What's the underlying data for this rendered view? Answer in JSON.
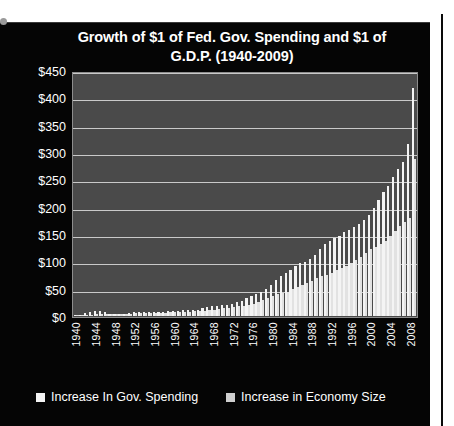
{
  "chart_data": {
    "type": "bar",
    "title": "Growth of $1 of Fed. Gov. Spending and  $1 of G.D.P. (1940-2009)",
    "title_line1": "Growth of $1 of Fed. Gov. Spending and  $1 of",
    "title_line2": "G.D.P. (1940-2009)",
    "xlabel": "",
    "ylabel": "",
    "ylim": [
      0,
      450
    ],
    "grid": true,
    "legend_position": "bottom",
    "ytick_labels": [
      "$450",
      "$400",
      "$350",
      "$300",
      "$250",
      "$200",
      "$150",
      "$100",
      "$50",
      "$0"
    ],
    "ytick_values": [
      450,
      400,
      350,
      300,
      250,
      200,
      150,
      100,
      50,
      0
    ],
    "xtick_labels": [
      "1940",
      "1944",
      "1948",
      "1952",
      "1956",
      "1960",
      "1964",
      "1968",
      "1972",
      "1976",
      "1980",
      "1984",
      "1988",
      "1992",
      "1996",
      "2000",
      "2004",
      "2008"
    ],
    "categories": [
      "1940",
      "1941",
      "1942",
      "1943",
      "1944",
      "1945",
      "1946",
      "1947",
      "1948",
      "1949",
      "1950",
      "1951",
      "1952",
      "1953",
      "1954",
      "1955",
      "1956",
      "1957",
      "1958",
      "1959",
      "1960",
      "1961",
      "1962",
      "1963",
      "1964",
      "1965",
      "1966",
      "1967",
      "1968",
      "1969",
      "1970",
      "1971",
      "1972",
      "1973",
      "1974",
      "1975",
      "1976",
      "1977",
      "1978",
      "1979",
      "1980",
      "1981",
      "1982",
      "1983",
      "1984",
      "1985",
      "1986",
      "1987",
      "1988",
      "1989",
      "1990",
      "1991",
      "1992",
      "1993",
      "1994",
      "1995",
      "1996",
      "1997",
      "1998",
      "1999",
      "2000",
      "2001",
      "2002",
      "2003",
      "2004",
      "2005",
      "2006",
      "2007",
      "2008",
      "2009"
    ],
    "series": [
      {
        "name": "Increase In Gov. Spending",
        "color": "#f4f4f4",
        "values": [
          1,
          2,
          5,
          8,
          10,
          10,
          7,
          4,
          3,
          4,
          4,
          5,
          7,
          8,
          7,
          7,
          7,
          8,
          8,
          9,
          9,
          10,
          11,
          11,
          12,
          12,
          14,
          16,
          18,
          19,
          20,
          21,
          23,
          25,
          28,
          34,
          37,
          41,
          45,
          50,
          58,
          66,
          73,
          79,
          84,
          92,
          97,
          100,
          106,
          113,
          123,
          132,
          138,
          143,
          148,
          155,
          159,
          164,
          170,
          178,
          187,
          199,
          214,
          228,
          240,
          257,
          272,
          284,
          318,
          420
        ]
      },
      {
        "name": "Increase in Economy Size",
        "color": "#e2e2e2",
        "values": [
          1,
          1,
          2,
          2,
          3,
          3,
          3,
          3,
          3,
          3,
          4,
          4,
          5,
          5,
          5,
          6,
          6,
          6,
          6,
          7,
          7,
          7,
          8,
          8,
          9,
          9,
          10,
          11,
          12,
          13,
          14,
          15,
          16,
          18,
          19,
          21,
          23,
          26,
          29,
          33,
          36,
          40,
          42,
          45,
          50,
          54,
          57,
          60,
          65,
          70,
          74,
          76,
          80,
          84,
          89,
          93,
          98,
          104,
          109,
          116,
          123,
          127,
          132,
          138,
          147,
          157,
          166,
          173,
          180,
          290
        ]
      }
    ],
    "legend": [
      {
        "label": "Increase In Gov. Spending",
        "swatch_color": "#f4f4f4"
      },
      {
        "label": "Increase in Economy Size",
        "swatch_color": "#cfcfcf"
      }
    ],
    "plot_background": "#4a4a4a",
    "slide_background": "#050505",
    "text_color": "#ffffff"
  }
}
